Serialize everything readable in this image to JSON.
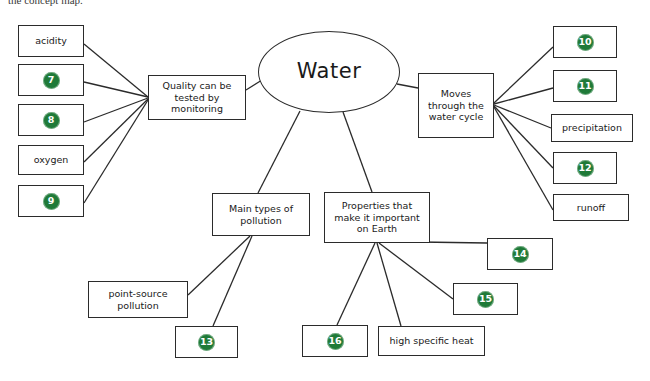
{
  "header": {
    "caption": "the concept map."
  },
  "colors": {
    "marker_green": "#1f7a38",
    "stroke": "#2b2b2b",
    "background": "#ffffff",
    "text": "#1a1a1a"
  },
  "diagram": {
    "type": "concept-map",
    "center": {
      "label": "Water",
      "shape": "ellipse"
    },
    "nodes": [
      {
        "id": "acidity",
        "label": "acidity",
        "kind": "text",
        "x": 18,
        "y": 25,
        "w": 66,
        "h": 32
      },
      {
        "id": "blank7",
        "label": "7",
        "kind": "blank",
        "x": 18,
        "y": 64,
        "w": 66,
        "h": 32
      },
      {
        "id": "blank8",
        "label": "8",
        "kind": "blank",
        "x": 18,
        "y": 104,
        "w": 66,
        "h": 32
      },
      {
        "id": "oxygen",
        "label": "oxygen",
        "kind": "text",
        "x": 18,
        "y": 145,
        "w": 66,
        "h": 30
      },
      {
        "id": "blank9",
        "label": "9",
        "kind": "blank",
        "x": 18,
        "y": 185,
        "w": 66,
        "h": 32
      },
      {
        "id": "quality",
        "label": "Quality can be\ntested by\nmonitoring",
        "kind": "text",
        "x": 148,
        "y": 75,
        "w": 98,
        "h": 45
      },
      {
        "id": "water",
        "label": "Water",
        "kind": "ellipse",
        "x": 258,
        "y": 31,
        "w": 142,
        "h": 82
      },
      {
        "id": "moves",
        "label": "Moves\nthrough the\nwater cycle",
        "kind": "text",
        "x": 418,
        "y": 73,
        "w": 76,
        "h": 65
      },
      {
        "id": "blank10",
        "label": "10",
        "kind": "blank",
        "x": 553,
        "y": 26,
        "w": 64,
        "h": 32
      },
      {
        "id": "blank11",
        "label": "11",
        "kind": "blank",
        "x": 553,
        "y": 70,
        "w": 64,
        "h": 32
      },
      {
        "id": "precipitation",
        "label": "precipitation",
        "kind": "text",
        "x": 551,
        "y": 114,
        "w": 82,
        "h": 28
      },
      {
        "id": "blank12",
        "label": "12",
        "kind": "blank",
        "x": 553,
        "y": 152,
        "w": 64,
        "h": 32
      },
      {
        "id": "runoff",
        "label": "runoff",
        "kind": "text",
        "x": 553,
        "y": 194,
        "w": 76,
        "h": 27
      },
      {
        "id": "pollution",
        "label": "Main types of\npollution",
        "kind": "text",
        "x": 212,
        "y": 193,
        "w": 98,
        "h": 43
      },
      {
        "id": "properties",
        "label": "Properties that\nmake it important\non Earth",
        "kind": "text",
        "x": 324,
        "y": 192,
        "w": 106,
        "h": 51
      },
      {
        "id": "pointsource",
        "label": "point-source\npollution",
        "kind": "text",
        "x": 88,
        "y": 281,
        "w": 100,
        "h": 37
      },
      {
        "id": "blank13",
        "label": "13",
        "kind": "blank",
        "x": 175,
        "y": 326,
        "w": 63,
        "h": 32
      },
      {
        "id": "blank14",
        "label": "14",
        "kind": "blank",
        "x": 487,
        "y": 238,
        "w": 66,
        "h": 32
      },
      {
        "id": "blank15",
        "label": "15",
        "kind": "blank",
        "x": 453,
        "y": 283,
        "w": 65,
        "h": 32
      },
      {
        "id": "blank16",
        "label": "16",
        "kind": "blank",
        "x": 302,
        "y": 325,
        "w": 66,
        "h": 32
      },
      {
        "id": "specificheat",
        "label": "high specific heat",
        "kind": "text",
        "x": 378,
        "y": 326,
        "w": 107,
        "h": 30
      }
    ],
    "edges": [
      {
        "from": "acidity",
        "to": "quality",
        "x1": 84,
        "y1": 44,
        "x2": 148,
        "y2": 97
      },
      {
        "from": "blank7",
        "to": "quality",
        "x1": 84,
        "y1": 82,
        "x2": 148,
        "y2": 97
      },
      {
        "from": "blank8",
        "to": "quality",
        "x1": 84,
        "y1": 122,
        "x2": 148,
        "y2": 98
      },
      {
        "from": "oxygen",
        "to": "quality",
        "x1": 84,
        "y1": 162,
        "x2": 148,
        "y2": 99
      },
      {
        "from": "blank9",
        "to": "quality",
        "x1": 84,
        "y1": 203,
        "x2": 148,
        "y2": 100
      },
      {
        "from": "quality",
        "to": "water",
        "x1": 246,
        "y1": 90,
        "x2": 262,
        "y2": 80
      },
      {
        "from": "water",
        "to": "moves",
        "x1": 397,
        "y1": 84,
        "x2": 418,
        "y2": 88
      },
      {
        "from": "moves",
        "to": "blank10",
        "x1": 494,
        "y1": 103,
        "x2": 553,
        "y2": 47
      },
      {
        "from": "moves",
        "to": "blank11",
        "x1": 494,
        "y1": 104,
        "x2": 553,
        "y2": 88
      },
      {
        "from": "moves",
        "to": "precipitation",
        "x1": 494,
        "y1": 105,
        "x2": 551,
        "y2": 128
      },
      {
        "from": "moves",
        "to": "blank12",
        "x1": 494,
        "y1": 106,
        "x2": 553,
        "y2": 168
      },
      {
        "from": "moves",
        "to": "runoff",
        "x1": 494,
        "y1": 107,
        "x2": 553,
        "y2": 210
      },
      {
        "from": "water",
        "to": "pollution",
        "x1": 300,
        "y1": 111,
        "x2": 258,
        "y2": 193
      },
      {
        "from": "water",
        "to": "properties",
        "x1": 343,
        "y1": 112,
        "x2": 372,
        "y2": 192
      },
      {
        "from": "pollution",
        "to": "pointsource",
        "x1": 250,
        "y1": 236,
        "x2": 188,
        "y2": 295
      },
      {
        "from": "pollution",
        "to": "blank13",
        "x1": 252,
        "y1": 236,
        "x2": 213,
        "y2": 326
      },
      {
        "from": "properties",
        "to": "blank16",
        "x1": 375,
        "y1": 243,
        "x2": 337,
        "y2": 325
      },
      {
        "from": "properties",
        "to": "specificheat",
        "x1": 377,
        "y1": 243,
        "x2": 401,
        "y2": 326
      },
      {
        "from": "properties",
        "to": "blank15",
        "x1": 379,
        "y1": 243,
        "x2": 453,
        "y2": 299
      },
      {
        "from": "properties",
        "to": "blank14",
        "x1": 419,
        "y1": 242,
        "x2": 487,
        "y2": 243
      }
    ]
  }
}
